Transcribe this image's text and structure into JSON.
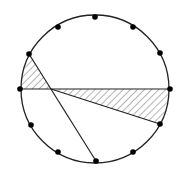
{
  "diagram": {
    "type": "circle-chord-geometry",
    "circle": {
      "cx": 95,
      "cy": 89,
      "r": 74
    },
    "points_count": 12,
    "points": [
      {
        "x": 95,
        "y": 17
      },
      {
        "x": 133,
        "y": 27
      },
      {
        "x": 160,
        "y": 53
      },
      {
        "x": 170,
        "y": 89
      },
      {
        "x": 160,
        "y": 124
      },
      {
        "x": 133,
        "y": 152
      },
      {
        "x": 96,
        "y": 161
      },
      {
        "x": 58,
        "y": 152
      },
      {
        "x": 31,
        "y": 125
      },
      {
        "x": 20,
        "y": 89
      },
      {
        "x": 29,
        "y": 54
      },
      {
        "x": 58,
        "y": 27
      }
    ],
    "chords": [
      {
        "from": 9,
        "to": 3,
        "label": "horizontal diameter"
      },
      {
        "from": 10,
        "to": 6,
        "label": "chord from upper-left to bottom"
      },
      {
        "from": 4,
        "to_intersection": true,
        "label": "chord from lower-right to intersection"
      }
    ],
    "intersection": {
      "x": 51,
      "y": 89
    },
    "shaded_regions": [
      {
        "name": "left-hatched-region",
        "vertices": [
          [
            29,
            54
          ],
          [
            51,
            89
          ],
          [
            20,
            89
          ]
        ],
        "arc_between": [
          9,
          10
        ]
      },
      {
        "name": "right-hatched-region",
        "vertices": [
          [
            51,
            89
          ],
          [
            170,
            89
          ],
          [
            160,
            124
          ]
        ],
        "arc_between": [
          3,
          4
        ]
      }
    ],
    "colors": {
      "stroke": "#222222",
      "point": "#000000",
      "hatch": "#444444",
      "background": "#ffffff"
    }
  }
}
